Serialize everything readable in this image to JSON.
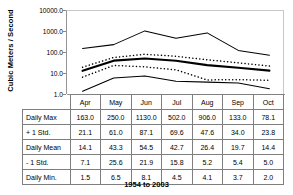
{
  "chart_data": {
    "type": "line",
    "title": "",
    "subtitle": "",
    "xlabel": "",
    "ylabel": "Cubic Meters / Second",
    "footer": "1954 to 2003",
    "yscale": "log",
    "ylim": [
      1.0,
      10000.0
    ],
    "ytick_labels": [
      "10000.0",
      "1000.0",
      "100.0",
      "10.0",
      "1.0"
    ],
    "ytick_values": [
      10000.0,
      1000.0,
      100.0,
      10.0,
      1.0
    ],
    "grid": false,
    "legend": "none",
    "categories": [
      "Apr",
      "May",
      "Jun",
      "Jul",
      "Aug",
      "Sep",
      "Oct"
    ],
    "series": [
      {
        "name": "Daily Max",
        "style": "solid-thin",
        "values": [
          163.0,
          250.0,
          1130.0,
          502.0,
          906.0,
          133.0,
          78.1
        ]
      },
      {
        "name": "+ 1 Std.",
        "style": "dotted",
        "values": [
          21.1,
          61.0,
          87.1,
          69.6,
          47.6,
          34.0,
          23.8
        ]
      },
      {
        "name": "Daily Mean",
        "style": "solid-thick",
        "values": [
          14.1,
          43.3,
          54.5,
          42.7,
          26.4,
          19.7,
          14.4
        ]
      },
      {
        "name": "- 1 Std.",
        "style": "dotted",
        "values": [
          7.1,
          25.6,
          21.9,
          15.8,
          5.2,
          5.4,
          5.0
        ]
      },
      {
        "name": "Daily Min.",
        "style": "solid-thin",
        "values": [
          1.5,
          6.5,
          8.1,
          4.5,
          4.1,
          3.7,
          2.0
        ]
      }
    ]
  },
  "table": {
    "corner_label": "",
    "column_headers": [
      "Apr",
      "May",
      "Jun",
      "Jul",
      "Aug",
      "Sep",
      "Oct"
    ],
    "rows": [
      {
        "label": "Daily Max",
        "cells": [
          "163.0",
          "250.0",
          "1130.0",
          "502.0",
          "906.0",
          "133.0",
          "78.1"
        ]
      },
      {
        "label": "+ 1 Std.",
        "cells": [
          "21.1",
          "61.0",
          "87.1",
          "69.6",
          "47.6",
          "34.0",
          "23.8"
        ]
      },
      {
        "label": "Daily Mean",
        "cells": [
          "14.1",
          "43.3",
          "54.5",
          "42.7",
          "26.4",
          "19.7",
          "14.4"
        ]
      },
      {
        "label": "- 1 Std.",
        "cells": [
          "7.1",
          "25.6",
          "21.9",
          "15.8",
          "5.2",
          "5.4",
          "5.0"
        ]
      },
      {
        "label": "Daily Min.",
        "cells": [
          "1.5",
          "6.5",
          "8.1",
          "4.5",
          "4.1",
          "3.7",
          "2.0"
        ]
      }
    ]
  },
  "colors": {
    "line": "#000000",
    "axis": "#949494",
    "border": "#7f7f7f",
    "background": "#ffffff"
  }
}
